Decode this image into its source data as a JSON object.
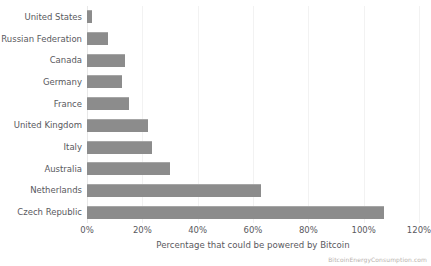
{
  "chart_data": {
    "type": "bar",
    "orientation": "horizontal",
    "title": "",
    "xlabel": "Percentage that could be powered by Bitcoin",
    "ylabel": "",
    "xlim": [
      0,
      120
    ],
    "xtick_values": [
      0,
      20,
      40,
      60,
      80,
      100,
      120
    ],
    "xtick_labels": [
      "0%",
      "20%",
      "40%",
      "60%",
      "80%",
      "100%",
      "120%"
    ],
    "grid": true,
    "legend": null,
    "bar_color": "#8c8c8c",
    "categories": [
      "United States",
      "Russian Federation",
      "Canada",
      "Germany",
      "France",
      "United Kingdom",
      "Italy",
      "Australia",
      "Netherlands",
      "Czech Republic"
    ],
    "values": [
      1.8,
      7.5,
      13.8,
      12.8,
      15.0,
      22.0,
      23.5,
      30.0,
      63.0,
      107.5
    ]
  },
  "footer": {
    "watermark": "BitcoinEnergyConsumption.com"
  }
}
